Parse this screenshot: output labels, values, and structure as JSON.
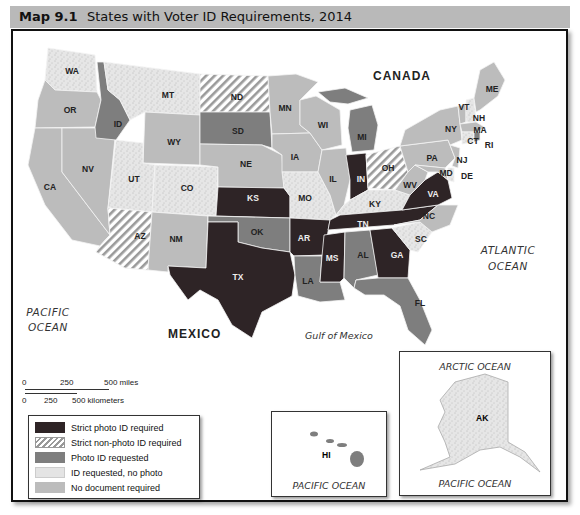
{
  "header": {
    "map_number": "Map 9.1",
    "title": "States with Voter ID Requirements, 2014"
  },
  "legend": {
    "items": [
      {
        "key": "strict_photo",
        "label": "Strict photo ID required",
        "color": "#2e2426",
        "pattern": "solid"
      },
      {
        "key": "strict_nonphoto",
        "label": "Strict non-photo ID required",
        "color": "#ffffff",
        "pattern": "diagonal-stripes"
      },
      {
        "key": "photo_requested",
        "label": "Photo ID requested",
        "color": "#7e7e7e",
        "pattern": "solid"
      },
      {
        "key": "id_requested",
        "label": "ID requested, no photo",
        "color": "#e4e4e4",
        "pattern": "stipple"
      },
      {
        "key": "none",
        "label": "No document required",
        "color": "#bcbcbc",
        "pattern": "solid"
      }
    ]
  },
  "scale_bar": {
    "miles_ticks": [
      "0",
      "250",
      "500 miles"
    ],
    "km_ticks": [
      "0",
      "250",
      "500 kilometers"
    ]
  },
  "geo_labels": {
    "canada": "CANADA",
    "mexico": "MEXICO",
    "atlantic_1": "ATLANTIC",
    "atlantic_2": "OCEAN",
    "pacific_1": "PACIFIC",
    "pacific_2": "OCEAN",
    "gulf": "Gulf of Mexico"
  },
  "insets": {
    "hawaii": {
      "state": "HI",
      "ocean": "PACIFIC OCEAN"
    },
    "alaska": {
      "state": "AK",
      "ocean_top": "ARCTIC OCEAN",
      "ocean_bottom": "PACIFIC OCEAN"
    }
  },
  "states": {
    "WA": "id_requested",
    "OR": "none",
    "CA": "none",
    "NV": "none",
    "ID": "photo_requested",
    "MT": "id_requested",
    "WY": "none",
    "UT": "id_requested",
    "CO": "id_requested",
    "AZ": "strict_nonphoto",
    "NM": "none",
    "ND": "strict_nonphoto",
    "SD": "photo_requested",
    "NE": "none",
    "KS": "strict_photo",
    "OK": "photo_requested",
    "TX": "strict_photo",
    "MN": "none",
    "IA": "none",
    "MO": "id_requested",
    "AR": "strict_photo",
    "LA": "photo_requested",
    "WI": "none",
    "IL": "none",
    "MI": "photo_requested",
    "IN": "strict_photo",
    "OH": "strict_nonphoto",
    "KY": "id_requested",
    "TN": "strict_photo",
    "MS": "strict_photo",
    "AL": "photo_requested",
    "GA": "strict_photo",
    "FL": "photo_requested",
    "SC": "id_requested",
    "NC": "none",
    "VA": "strict_photo",
    "WV": "none",
    "PA": "none",
    "NY": "none",
    "VT": "none",
    "NH": "id_requested",
    "ME": "none",
    "MA": "none",
    "CT": "id_requested",
    "RI": "photo_requested",
    "NJ": "none",
    "DE": "id_requested",
    "MD": "none",
    "AK": "id_requested",
    "HI": "photo_requested"
  }
}
